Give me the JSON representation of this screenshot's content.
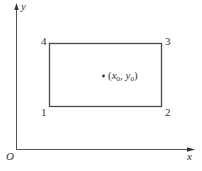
{
  "diagram": {
    "type": "coordinate-rectangle",
    "axes": {
      "x_label": "x",
      "y_label": "y",
      "origin_label": "O"
    },
    "rectangle": {
      "corners": [
        {
          "id": "1",
          "label": "1",
          "position": "bottom-left"
        },
        {
          "id": "2",
          "label": "2",
          "position": "bottom-right"
        },
        {
          "id": "3",
          "label": "3",
          "position": "top-right"
        },
        {
          "id": "4",
          "label": "4",
          "position": "top-left"
        }
      ]
    },
    "point": {
      "label_open": "(",
      "x_var": "x",
      "x_sub": "0",
      "sep": ", ",
      "y_var": "y",
      "y_sub": "0",
      "label_close": ")"
    },
    "colors": {
      "line": "#4a4a4a",
      "text": "#333333",
      "background": "#ffffff"
    }
  }
}
